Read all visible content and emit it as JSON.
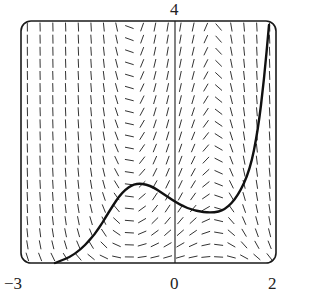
{
  "chart_data": {
    "type": "slope_field",
    "title": "",
    "xlabel": "",
    "ylabel": "",
    "xlim": [
      -3,
      2
    ],
    "x_tick_labels": [
      "-3",
      "0",
      "2"
    ],
    "y_tick_labels": [
      "4"
    ],
    "grid": false,
    "legend": "none",
    "field_columns": 20,
    "field_rows": 20,
    "solution_curve": {
      "description": "single solution curve: rises from lower-left, local max near x=-0.8, local min near x=0.8, then rises steeply to upper-right",
      "points_px": [
        [
          55,
          263
        ],
        [
          75,
          255
        ],
        [
          95,
          235
        ],
        [
          110,
          210
        ],
        [
          122,
          192
        ],
        [
          135,
          183
        ],
        [
          150,
          185
        ],
        [
          165,
          195
        ],
        [
          180,
          205
        ],
        [
          195,
          211
        ],
        [
          212,
          213
        ],
        [
          225,
          210
        ],
        [
          238,
          196
        ],
        [
          250,
          170
        ],
        [
          258,
          130
        ],
        [
          264,
          80
        ],
        [
          269,
          25
        ]
      ]
    }
  },
  "labels": {
    "y_top": "4",
    "x_left": "−3",
    "x_zero": "0",
    "x_right": "2"
  },
  "colors": {
    "ink": "#1a1a1a",
    "field": "#333333",
    "background": "#ffffff"
  }
}
